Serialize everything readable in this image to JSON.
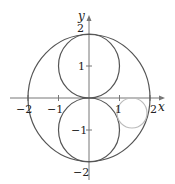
{
  "diagram": {
    "title": "",
    "axes": {
      "x_label": "x",
      "y_label": "y",
      "x_ticks": [
        {
          "value": -2,
          "label": "−2"
        },
        {
          "value": -1,
          "label": "−1"
        },
        {
          "value": 1,
          "label": "1"
        },
        {
          "value": 2,
          "label": "2"
        }
      ],
      "y_ticks": [
        {
          "value": 2,
          "label": "2"
        },
        {
          "value": 1,
          "label": "1"
        },
        {
          "value": -1,
          "label": "−1"
        },
        {
          "value": -2,
          "label": "−2"
        }
      ]
    },
    "shapes": [
      {
        "name": "outer-circle",
        "center": [
          0,
          0
        ],
        "radius": 2,
        "color": "#555555"
      },
      {
        "name": "upper-circle",
        "center": [
          0,
          1
        ],
        "radius": 1,
        "color": "#555555"
      },
      {
        "name": "lower-circle",
        "center": [
          0,
          -1
        ],
        "radius": 1,
        "color": "#555555"
      },
      {
        "name": "small-gray-circle",
        "center": [
          1.4,
          -0.5
        ],
        "radius": 0.48,
        "color": "#bbbbbb"
      }
    ],
    "colors": {
      "curve": "#555555",
      "axis": "#777777",
      "highlight": "#bbbbbb"
    }
  }
}
